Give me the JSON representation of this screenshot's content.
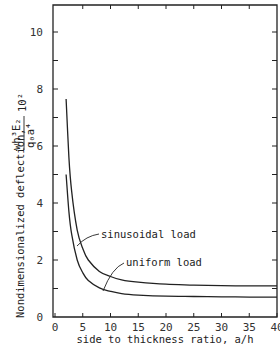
{
  "chart_data": {
    "type": "line",
    "title": "",
    "xlabel": "side to thickness ratio, a/h",
    "ylabel": "Nondimensionalized deflection,",
    "ylabel_formula": {
      "numerator": "wh³E₂",
      "denominator": "q₀a⁴",
      "multiplier": "10²"
    },
    "xlim": [
      0,
      40
    ],
    "ylim": [
      0,
      11
    ],
    "xticks": [
      "0",
      "5",
      "10",
      "15",
      "20",
      "25",
      "30",
      "35",
      "40"
    ],
    "yticks": [
      "0",
      "2",
      "4",
      "6",
      "8",
      "10"
    ],
    "grid": false,
    "legend": "inline annotations",
    "series": [
      {
        "name": "sinusoidal load",
        "x": [
          2,
          2.5,
          3,
          4,
          5,
          6,
          8,
          10,
          12,
          15,
          20,
          25,
          30,
          35,
          40
        ],
        "values": [
          7.65,
          5.6,
          4.4,
          3.05,
          2.4,
          2.0,
          1.6,
          1.42,
          1.3,
          1.22,
          1.15,
          1.12,
          1.1,
          1.09,
          1.09
        ]
      },
      {
        "name": "uniform load",
        "x": [
          2,
          2.5,
          3,
          4,
          5,
          6,
          8,
          10,
          12,
          15,
          20,
          25,
          30,
          35,
          40
        ],
        "values": [
          5.0,
          3.7,
          2.9,
          2.0,
          1.55,
          1.28,
          1.02,
          0.9,
          0.82,
          0.77,
          0.73,
          0.72,
          0.71,
          0.7,
          0.7
        ]
      }
    ],
    "annotations": [
      {
        "text": "sinusoidal load",
        "series": "sinusoidal load"
      },
      {
        "text": "uniform load",
        "series": "uniform load"
      }
    ]
  }
}
